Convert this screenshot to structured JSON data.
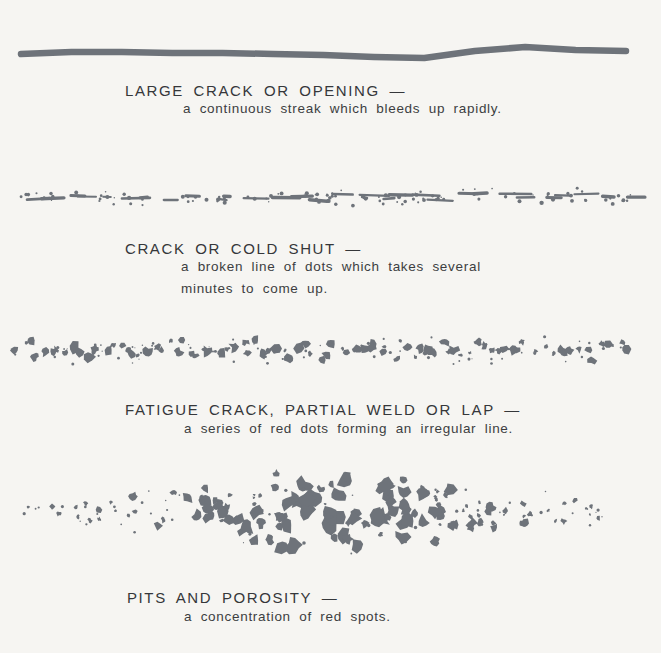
{
  "palette": {
    "background": "#f6f5f2",
    "mark": "#6e737a",
    "title_text": "#35373a",
    "body_text": "#3c3e41"
  },
  "sections": [
    {
      "title": "LARGE CRACK OR OPENING —",
      "desc_lines": [
        "a continuous streak which bleeds up rapidly."
      ]
    },
    {
      "title": "CRACK OR COLD SHUT —",
      "desc_lines": [
        "a broken line of dots which takes several",
        "minutes to come up."
      ]
    },
    {
      "title": "FATIGUE CRACK, PARTIAL WELD OR LAP —",
      "desc_lines": [
        "a series of red dots forming an irregular line."
      ]
    },
    {
      "title": "PITS AND POROSITY —",
      "desc_lines": [
        "a concentration of red spots."
      ]
    }
  ],
  "indications": [
    {
      "kind": "streak",
      "x1": 21,
      "x2": 626,
      "y": 53,
      "thickness": 6.5,
      "seed": 11
    },
    {
      "kind": "dashline",
      "x1": 16,
      "x2": 633,
      "y": 197,
      "seed": 42,
      "dash_count": 30,
      "dot_count": 115
    },
    {
      "kind": "blobline",
      "x1": 14,
      "x2": 631,
      "y": 350,
      "seed": 7,
      "blob_count": 90,
      "speck_count": 72
    },
    {
      "kind": "cluster",
      "x1": 22,
      "x2": 622,
      "cx": 330,
      "cy": 511,
      "seed": 99,
      "blob_count": 155,
      "speck_count": 60,
      "spread_min": 9,
      "spread_max": 50,
      "r_min": 1.3,
      "r_max": 8.5
    }
  ]
}
